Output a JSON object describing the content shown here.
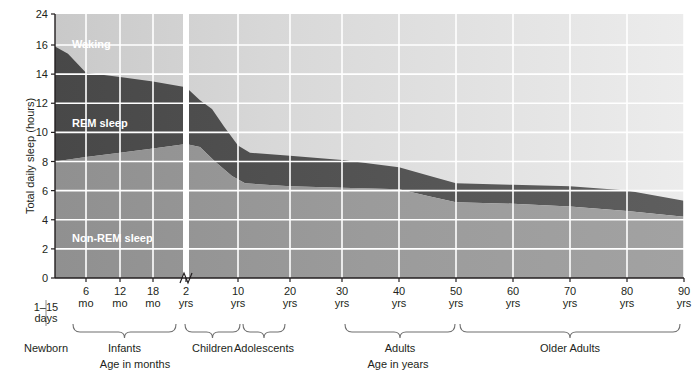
{
  "chart_data": {
    "type": "area",
    "title": "",
    "xlabel": "Age in months / Age in years",
    "ylabel": "Total daily sleep (hours)",
    "ylim": [
      0,
      24
    ],
    "grid": true,
    "legend_position": "inside-plot",
    "y_ticks": [
      0,
      2,
      4,
      6,
      8,
      10,
      12,
      14,
      16,
      24
    ],
    "y_axis_break_between": [
      16,
      24
    ],
    "x_ticks": [
      {
        "label": "6",
        "unit": "mo",
        "px": 86
      },
      {
        "label": "12",
        "unit": "mo",
        "px": 120
      },
      {
        "label": "18",
        "unit": "mo",
        "px": 153
      },
      {
        "label": "2",
        "unit": "yrs",
        "px": 186
      },
      {
        "label": "10",
        "unit": "yrs",
        "px": 238
      },
      {
        "label": "20",
        "unit": "yrs",
        "px": 290
      },
      {
        "label": "30",
        "unit": "yrs",
        "px": 342
      },
      {
        "label": "40",
        "unit": "yrs",
        "px": 399
      },
      {
        "label": "50",
        "unit": "yrs",
        "px": 456
      },
      {
        "label": "60",
        "unit": "yrs",
        "px": 513
      },
      {
        "label": "70",
        "unit": "yrs",
        "px": 570
      },
      {
        "label": "80",
        "unit": "yrs",
        "px": 627
      },
      {
        "label": "90",
        "unit": "yrs",
        "px": 684
      }
    ],
    "x_axis_break_px": 186,
    "series": [
      {
        "name": "Non-REM sleep",
        "color": "#9a9a9a",
        "description": "hours of non-REM sleep per day (lower band, from 0)",
        "points": [
          {
            "px": 55,
            "hours": 8.0
          },
          {
            "px": 86,
            "hours": 8.3
          },
          {
            "px": 120,
            "hours": 8.6
          },
          {
            "px": 153,
            "hours": 8.9
          },
          {
            "px": 186,
            "hours": 9.2
          },
          {
            "px": 200,
            "hours": 9.0
          },
          {
            "px": 215,
            "hours": 8.0
          },
          {
            "px": 232,
            "hours": 7.0
          },
          {
            "px": 245,
            "hours": 6.5
          },
          {
            "px": 290,
            "hours": 6.3
          },
          {
            "px": 342,
            "hours": 6.2
          },
          {
            "px": 399,
            "hours": 6.1
          },
          {
            "px": 430,
            "hours": 5.6
          },
          {
            "px": 456,
            "hours": 5.2
          },
          {
            "px": 513,
            "hours": 5.1
          },
          {
            "px": 570,
            "hours": 4.9
          },
          {
            "px": 627,
            "hours": 4.6
          },
          {
            "px": 684,
            "hours": 4.2
          }
        ]
      },
      {
        "name": "REM sleep",
        "color": "#4d4d4d",
        "description": "cumulative top edge of REM band = total daily sleep",
        "points": [
          {
            "px": 55,
            "hours": 15.9
          },
          {
            "px": 68,
            "hours": 15.4
          },
          {
            "px": 86,
            "hours": 14.1
          },
          {
            "px": 120,
            "hours": 13.8
          },
          {
            "px": 153,
            "hours": 13.5
          },
          {
            "px": 186,
            "hours": 13.1
          },
          {
            "px": 200,
            "hours": 12.2
          },
          {
            "px": 212,
            "hours": 11.6
          },
          {
            "px": 224,
            "hours": 10.4
          },
          {
            "px": 238,
            "hours": 9.1
          },
          {
            "px": 250,
            "hours": 8.6
          },
          {
            "px": 290,
            "hours": 8.4
          },
          {
            "px": 342,
            "hours": 8.1
          },
          {
            "px": 399,
            "hours": 7.6
          },
          {
            "px": 430,
            "hours": 7.0
          },
          {
            "px": 456,
            "hours": 6.5
          },
          {
            "px": 513,
            "hours": 6.4
          },
          {
            "px": 570,
            "hours": 6.3
          },
          {
            "px": 627,
            "hours": 6.0
          },
          {
            "px": 684,
            "hours": 5.3
          }
        ]
      },
      {
        "name": "Waking",
        "color": "#d4d4d4",
        "description": "remaining waking hours, fills to 24 h at top of plot",
        "points": []
      }
    ],
    "band_labels": [
      {
        "text": "Waking",
        "x": 72,
        "y": 38
      },
      {
        "text": "REM sleep",
        "x": 72,
        "y": 117
      },
      {
        "text": "Non-REM sleep",
        "x": 72,
        "y": 232
      }
    ],
    "age_groups": [
      {
        "label": "Newborn",
        "x1": 46,
        "x2": 46,
        "brace": false,
        "sub": "1–15\ndays"
      },
      {
        "label": "Infants",
        "x1": 73,
        "x2": 176,
        "brace": true
      },
      {
        "label": "Children",
        "x1": 185,
        "x2": 240,
        "brace": true
      },
      {
        "label": "Adolescents",
        "x1": 243,
        "x2": 285,
        "brace": true
      },
      {
        "label": "Adults",
        "x1": 345,
        "x2": 455,
        "brace": true
      },
      {
        "label": "Older Adults",
        "x1": 460,
        "x2": 680,
        "brace": true
      }
    ],
    "axis_names": [
      {
        "text": "Age in months",
        "x": 135
      },
      {
        "text": "Age in years",
        "x": 398
      }
    ],
    "newborn_note": {
      "line1": "1–15",
      "line2": "days",
      "label": "Newborn"
    },
    "colors": {
      "waking": "#d4d4d4",
      "rem": "#4d4d4d",
      "nonrem": "#9a9a9a",
      "grid": "#ffffff",
      "axis": "#231f20",
      "text": "#231f20"
    }
  }
}
